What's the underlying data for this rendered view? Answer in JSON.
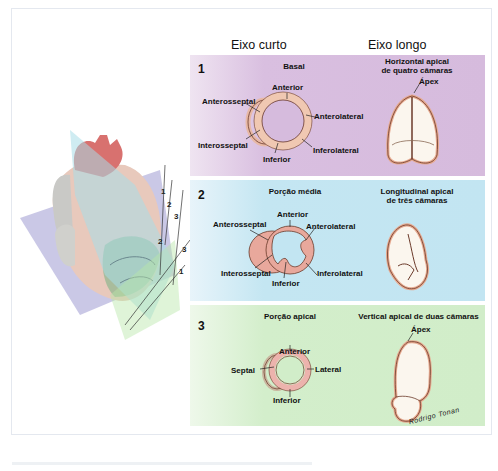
{
  "columns": {
    "short_axis": "Eixo curto",
    "long_axis": "Eixo longo"
  },
  "panels": [
    {
      "number": "1",
      "color": "#d6bbdd",
      "short_axis_title": "Basal",
      "long_axis_title_line1": "Horizontal apical",
      "long_axis_title_line2": "de quatro câmaras",
      "labels": [
        "Anterior",
        "Anterosseptal",
        "Anterolateral",
        "Interosseptal",
        "Inferior",
        "Inferolateral"
      ],
      "apex_label": "Ápex"
    },
    {
      "number": "2",
      "color": "#c2e5f2",
      "short_axis_title": "Porção média",
      "long_axis_title_line1": "Longitudinal apical",
      "long_axis_title_line2": "de três câmaras",
      "labels": [
        "Anterior",
        "Anterosseptal",
        "Anterolateral",
        "Interosseptal",
        "Inferior",
        "Inferolateral"
      ]
    },
    {
      "number": "3",
      "color": "#d1edc9",
      "short_axis_title": "Porção apical",
      "long_axis_title": "Vertical apical de duas câmaras",
      "labels": [
        "Anterior",
        "Septal",
        "Lateral",
        "Inferior"
      ],
      "apex_label": "Ápex"
    }
  ],
  "heart_planes": {
    "labels": [
      "1",
      "2",
      "3",
      "2",
      "3",
      "1"
    ]
  },
  "signature": "Rodrigo Tonan"
}
